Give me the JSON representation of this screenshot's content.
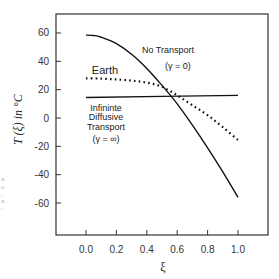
{
  "chart_data": {
    "type": "line",
    "title": "",
    "xlabel": "ξ",
    "ylabel": "T (ξ)  in °C",
    "xlim": [
      -0.18,
      1.2
    ],
    "ylim": [
      -80,
      73
    ],
    "x_ticks": [
      0.0,
      0.2,
      0.4,
      0.6,
      0.8,
      1.0
    ],
    "x_tick_labels": [
      "0.0",
      "0.2",
      "0.4",
      "0.6",
      "0.8",
      "1.0"
    ],
    "y_ticks": [
      60,
      40,
      20,
      0,
      -20,
      -40,
      -60
    ],
    "y_tick_labels": [
      "60",
      "40",
      "20",
      "0",
      "-20",
      "-40",
      "-60"
    ],
    "grid": false,
    "legend": "none (inline annotations)",
    "series": [
      {
        "name": "No Transport (γ = 0)",
        "style": "solid",
        "x": [
          0.0,
          0.05,
          0.1,
          0.2,
          0.3,
          0.4,
          0.5,
          0.6,
          0.7,
          0.8,
          0.9,
          1.0
        ],
        "y": [
          58.5,
          58.2,
          57,
          52.5,
          45,
          35,
          23,
          10,
          -5,
          -21,
          -38,
          -56
        ]
      },
      {
        "name": "Earth",
        "style": "dotted",
        "x": [
          0.0,
          0.1,
          0.2,
          0.3,
          0.4,
          0.5,
          0.6,
          0.7,
          0.8,
          0.9,
          1.0
        ],
        "y": [
          28,
          27.8,
          27.2,
          26.4,
          25,
          22,
          16,
          9,
          2,
          -6.5,
          -15.5
        ]
      },
      {
        "name": "Infinite Diffusive Transport (γ = ∞)",
        "style": "solid",
        "x": [
          0.0,
          1.0
        ],
        "y": [
          14.5,
          16
        ]
      }
    ],
    "annotations": [
      {
        "id": "no_transport",
        "lines": [
          "No Transport",
          "(γ = 0)"
        ]
      },
      {
        "id": "earth",
        "lines": [
          "Earth"
        ]
      },
      {
        "id": "infinite",
        "lines": [
          "Infininte",
          "Diffusive",
          "Transport",
          "(γ = ∞)"
        ]
      }
    ]
  },
  "margin_artifacts": [
    "a",
    "o",
    "-",
    "a",
    "-"
  ]
}
